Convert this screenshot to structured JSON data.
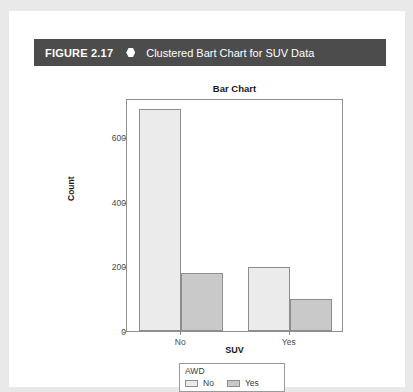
{
  "figure": {
    "label": "FIGURE 2.17",
    "bullet_icon": "hexagon-bullet-icon",
    "caption": "Clustered Bart Chart for SUV Data",
    "header_bg": "#4c4c4c",
    "header_text_color": "#ffffff"
  },
  "chart_data": {
    "type": "bar",
    "title": "Bar Chart",
    "xlabel": "SUV",
    "ylabel": "Count",
    "categories": [
      "No",
      "Yes"
    ],
    "series": [
      {
        "name": "No",
        "values": [
          685,
          197
        ],
        "color": "#ebebeb"
      },
      {
        "name": "Yes",
        "values": [
          180,
          98
        ],
        "color": "#c9c9c9"
      }
    ],
    "legend_title": "AWD",
    "legend_position": "bottom",
    "grid": false,
    "ylim": [
      0,
      720
    ],
    "yticks": [
      0,
      200,
      400,
      600
    ],
    "ytick_labels": [
      "0",
      "200",
      "400",
      "600"
    ],
    "xtick_labels": [
      "No",
      "Yes"
    ],
    "axis_color": "#8f8f8f",
    "bar_border_color": "#8d8d8d",
    "tick_text_color": "#4a4a4a"
  },
  "legend": {
    "title": "AWD",
    "items": [
      {
        "label": "No",
        "color": "#ebebeb"
      },
      {
        "label": "Yes",
        "color": "#c9c9c9"
      }
    ]
  }
}
